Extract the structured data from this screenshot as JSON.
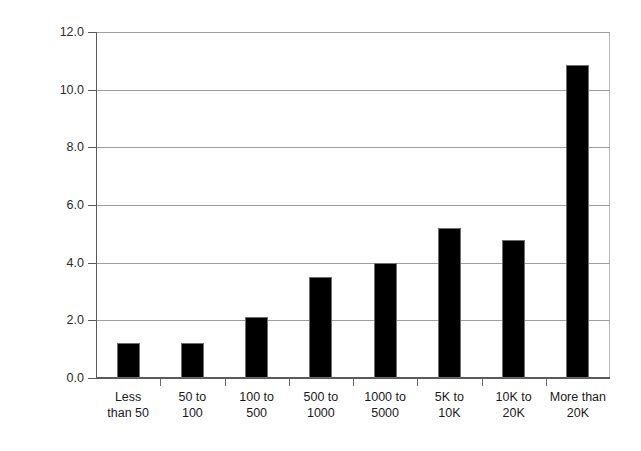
{
  "chart_data": {
    "type": "bar",
    "title": "",
    "xlabel": "",
    "ylabel": "Average FTE dedicated to change management",
    "categories": [
      "Less than 50",
      "50 to 100",
      "100 to 500",
      "500 to 1000",
      "1000 to 5000",
      "5K to 10K",
      "10K to 20K",
      "More than 20K"
    ],
    "category_lines": [
      [
        "Less",
        "than 50"
      ],
      [
        "50 to",
        "100"
      ],
      [
        "100 to",
        "500"
      ],
      [
        "500 to",
        "1000"
      ],
      [
        "1000 to",
        "5000"
      ],
      [
        "5K to",
        "10K"
      ],
      [
        "10K to",
        "20K"
      ],
      [
        "More than",
        "20K"
      ]
    ],
    "values": [
      1.2,
      1.2,
      2.1,
      3.5,
      4.0,
      5.2,
      4.8,
      10.85
    ],
    "ylim": [
      0,
      12
    ],
    "ytick_values": [
      0,
      2,
      4,
      6,
      8,
      10,
      12
    ],
    "ytick_labels": [
      "0.0",
      "2.0",
      "4.0",
      "6.0",
      "8.0",
      "10.0",
      "12.0"
    ],
    "grid": "horizontal",
    "legend": "none",
    "bar_color": "#000000",
    "bar_edge_color": "#6e6e6e",
    "grid_color": "#9d9d9d",
    "axis_color": "#5a5a5a",
    "background_color": "#ffffff"
  }
}
